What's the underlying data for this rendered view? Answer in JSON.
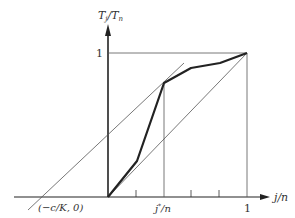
{
  "diagram": {
    "y_axis_label": "T_j/T_n",
    "y_axis_label_main": "T",
    "y_axis_label_sub1": "j",
    "y_axis_label_slash": "/T",
    "y_axis_label_sub2": "n",
    "x_axis_label": "j/n",
    "y_tick_label": "1",
    "x_tick_labels": {
      "intercept": "(−c/K, 0)",
      "jstar": "j*/n",
      "jstar_main": "j",
      "jstar_sup": "*",
      "jstar_rest": "/n",
      "one": "1"
    },
    "curve_points_px": [
      [
        108,
        197
      ],
      [
        137,
        161
      ],
      [
        164,
        83
      ],
      [
        191,
        68
      ],
      [
        220,
        63
      ],
      [
        247,
        53
      ]
    ],
    "colors": {
      "curve": "#222222",
      "thin": "#555555",
      "axis": "#222222"
    }
  }
}
